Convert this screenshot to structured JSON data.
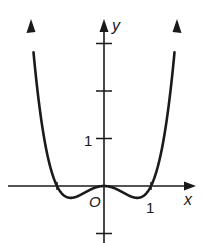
{
  "chart_data": {
    "type": "line",
    "title": "",
    "xlabel": "x",
    "ylabel": "y",
    "function": "y = x^4 - x^2",
    "xlim": [
      -2.2,
      2.1
    ],
    "ylim": [
      -1.0,
      3.5
    ],
    "x_ticks": [
      {
        "value": 1,
        "label": "1"
      }
    ],
    "y_ticks": [
      {
        "value": -1,
        "label": ""
      },
      {
        "value": 1,
        "label": "1"
      },
      {
        "value": 2,
        "label": ""
      },
      {
        "value": 3,
        "label": ""
      }
    ],
    "origin_label": "O",
    "grid": false,
    "series": [
      {
        "name": "curve",
        "x": [
          -1.45,
          -1.3,
          -1.2,
          -1.1,
          -1.0,
          -0.9,
          -0.707,
          -0.5,
          -0.3,
          0,
          0.3,
          0.5,
          0.707,
          0.9,
          1.0,
          1.1,
          1.2,
          1.3,
          1.45
        ],
        "y": [
          2.32,
          1.17,
          0.63,
          0.25,
          0,
          -0.15,
          -0.25,
          -0.19,
          -0.08,
          0,
          -0.08,
          -0.19,
          -0.25,
          -0.15,
          0,
          0.25,
          0.63,
          1.17,
          2.32
        ]
      }
    ],
    "features": {
      "roots": [
        -1,
        0,
        1
      ],
      "local_minima": [
        [
          -0.707,
          -0.25
        ],
        [
          0.707,
          -0.25
        ]
      ],
      "local_maximum": [
        0,
        0
      ]
    }
  },
  "labels": {
    "x_axis": "x",
    "y_axis": "y",
    "origin": "O",
    "x_tick_1": "1",
    "y_tick_1": "1"
  },
  "style": {
    "line_color": "#1a1a1a",
    "background": "#ffffff"
  }
}
